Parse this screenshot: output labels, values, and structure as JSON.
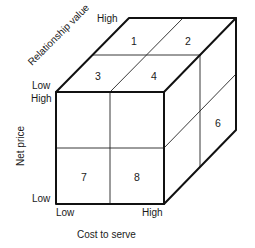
{
  "diagram": {
    "type": "3d-cube-segmentation",
    "axes": {
      "relationship_value": {
        "label": "Relationship value",
        "low": "Low",
        "high": "High"
      },
      "net_price": {
        "label": "Net price",
        "low": "Low",
        "high": "High"
      },
      "cost_to_serve": {
        "label": "Cost to serve",
        "low": "Low",
        "high": "High"
      }
    },
    "cells": {
      "top_face": [
        "1",
        "2",
        "3",
        "4"
      ],
      "side_face": [
        "6"
      ],
      "front_face": [
        "7",
        "8"
      ]
    },
    "colors": {
      "line": "#111111",
      "background": "#ffffff",
      "text": "#1a1a1a"
    }
  }
}
